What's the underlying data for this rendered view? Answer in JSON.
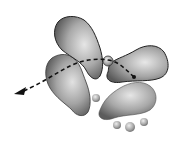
{
  "diagram": {
    "type": "orbital-lobes-with-reaction-path",
    "colors": {
      "background": "#ffffff",
      "lobe_highlight": "#e2e2e2",
      "lobe_mid": "#a8a8a8",
      "lobe_shadow": "#5e5e5e",
      "outline": "#2a2a2a",
      "path": "#111111"
    },
    "lobes": [
      {
        "name": "top-lobe"
      },
      {
        "name": "left-lobe"
      },
      {
        "name": "right-lobe"
      },
      {
        "name": "bottom-right-lobe"
      }
    ],
    "small_spheres": [
      {
        "name": "center-sphere",
        "cx": 108,
        "cy": 61,
        "r": 5
      },
      {
        "name": "small-sphere-1",
        "cx": 96,
        "cy": 98,
        "r": 4
      },
      {
        "name": "small-sphere-2",
        "cx": 117,
        "cy": 125,
        "r": 4
      },
      {
        "name": "small-sphere-3",
        "cx": 130,
        "cy": 127,
        "r": 5
      },
      {
        "name": "small-sphere-4",
        "cx": 144,
        "cy": 122,
        "r": 4
      }
    ],
    "path": {
      "style": "dashed",
      "arrowhead": "left",
      "start_marker": "dot"
    }
  }
}
